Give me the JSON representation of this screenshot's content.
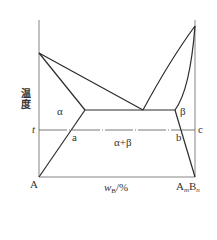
{
  "diagram": {
    "type": "binary-phase-diagram",
    "y_axis_label": "温度",
    "x_axis_label": {
      "symbol": "w",
      "subscript": "B",
      "unit": "/%"
    },
    "left_component": "A",
    "right_component": {
      "A": "A",
      "m": "m",
      "B": "B",
      "n": "n"
    },
    "temperature_line_label": "t",
    "phase_labels": {
      "alpha": "α",
      "beta": "β",
      "alpha_beta": "α+β"
    },
    "point_labels": {
      "a": "a",
      "b": "b",
      "c": "c"
    },
    "colors": {
      "line": "#2b2b2b",
      "axis": "#555555",
      "background": "#ffffff"
    }
  }
}
